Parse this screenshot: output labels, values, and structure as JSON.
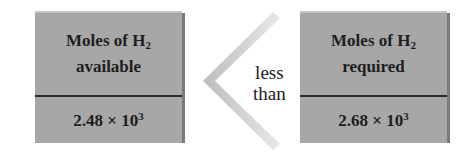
{
  "left_box": {
    "title_prefix": "Moles of H",
    "subscript": "2",
    "title_line2": "available",
    "value_mantissa": "2.48 × 10",
    "value_exponent": "3"
  },
  "comparison": {
    "line1": "less",
    "line2": "than",
    "symbol": "less-than-chevron"
  },
  "right_box": {
    "title_prefix": "Moles of H",
    "subscript": "2",
    "title_line2": "required",
    "value_mantissa": "2.68 × 10",
    "value_exponent": "3"
  },
  "colors": {
    "box_fill": "#a7a7a7",
    "divider": "#2a2a2a",
    "arrow": "#d0d0d0"
  }
}
